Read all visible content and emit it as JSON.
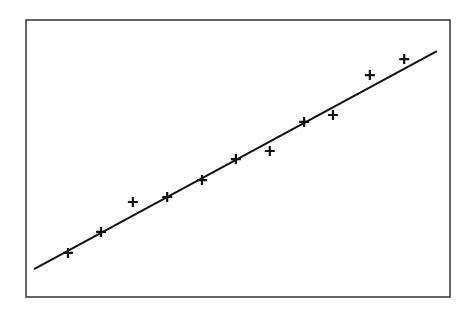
{
  "chart_data": {
    "type": "scatter",
    "title": "",
    "xlabel": "",
    "ylabel": "",
    "grid": false,
    "legend": null,
    "xlim": [
      0,
      100
    ],
    "ylim": [
      0,
      100
    ],
    "points": [
      {
        "x": 9.9,
        "y": 15.9
      },
      {
        "x": 17.7,
        "y": 23.5
      },
      {
        "x": 25.2,
        "y": 34.3
      },
      {
        "x": 33.3,
        "y": 36.1
      },
      {
        "x": 41.5,
        "y": 42.2
      },
      {
        "x": 49.5,
        "y": 49.8
      },
      {
        "x": 57.5,
        "y": 52.7
      },
      {
        "x": 65.6,
        "y": 63.2
      },
      {
        "x": 72.4,
        "y": 65.7
      },
      {
        "x": 81.1,
        "y": 80.1
      },
      {
        "x": 89.2,
        "y": 85.9
      }
    ],
    "fit_line": {
      "x1": 1.9,
      "y1": 10.1,
      "x2": 96.9,
      "y2": 88.8
    },
    "marker": "+",
    "color": "#111111"
  }
}
